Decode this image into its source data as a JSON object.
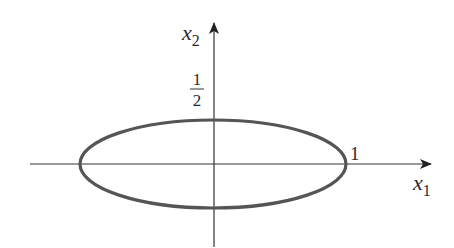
{
  "diagram": {
    "type": "ellipse-on-axes",
    "axes": {
      "horizontal": {
        "label": "x",
        "subscript": "1"
      },
      "vertical": {
        "label": "x",
        "subscript": "2"
      }
    },
    "ellipse": {
      "semi_axis_x": 1,
      "semi_axis_y": 0.5,
      "stroke_color": "#555555"
    },
    "annotations": {
      "x_intercept_label": "1",
      "y_intercept_numerator": "1",
      "y_intercept_denominator": "2"
    },
    "colors": {
      "axis": "#333333",
      "ellipse": "#555555",
      "text": "#2a2a2a"
    }
  }
}
